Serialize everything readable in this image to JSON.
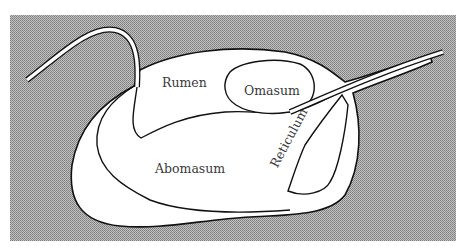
{
  "diagram": {
    "type": "anatomical-schematic",
    "labels": {
      "rumen": "Rumen",
      "omasum": "Omasum",
      "abomasum": "Abomasum",
      "reticulum": "Reticulum"
    },
    "colors": {
      "background_pattern": "#a8a8a8",
      "organ_fill": "#ffffff",
      "outline": "#111111",
      "label_text": "#3a3a3a"
    }
  }
}
